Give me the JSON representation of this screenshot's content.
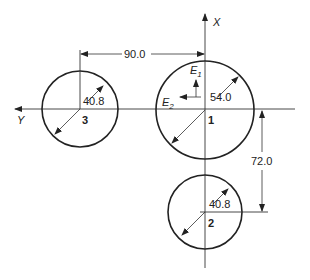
{
  "axes": {
    "x_label": "X",
    "y_label": "Y"
  },
  "dimensions": {
    "horizontal_spacing": "90.0",
    "vertical_spacing": "72.0"
  },
  "vectors": {
    "e1_base": "E",
    "e1_sub": "1",
    "e2_base": "E",
    "e2_sub": "2"
  },
  "circles": [
    {
      "id": "1",
      "label": "1",
      "diameter": "54.0"
    },
    {
      "id": "2",
      "label": "2",
      "diameter": "40.8"
    },
    {
      "id": "3",
      "label": "3",
      "diameter": "40.8"
    }
  ],
  "colors": {
    "line": "#333333",
    "background": "#ffffff"
  }
}
